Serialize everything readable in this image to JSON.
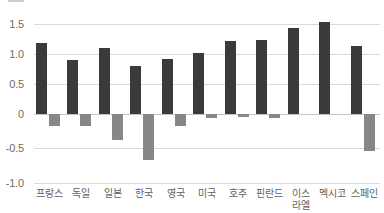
{
  "chart_data": {
    "type": "bar",
    "title": "",
    "subtitle": "",
    "xlabel": "",
    "ylabel": "",
    "ylim": [
      -1.0,
      1.5
    ],
    "yticks": [
      "1.5",
      "1.0",
      "0.5",
      "0",
      "-0.5",
      "-1.0"
    ],
    "ytick_values": [
      1.5,
      1.0,
      0.5,
      0,
      -0.5,
      -1.0
    ],
    "grid": true,
    "legend": "",
    "legend_position": "top-left",
    "categories": [
      "프랑스",
      "독일",
      "일본",
      "한국",
      "영국",
      "미국",
      "호주",
      "핀란드",
      "이스\n라엘",
      "멕시코",
      "스페인"
    ],
    "series": [
      {
        "name": "series-1",
        "color": "#3a3a3a",
        "values": [
          1.19,
          0.9,
          1.1,
          0.8,
          0.91,
          1.01,
          1.22,
          1.23,
          1.43,
          1.53,
          1.14
        ]
      },
      {
        "name": "series-2",
        "color": "#878787",
        "values": [
          -0.17,
          -0.17,
          -0.38,
          -0.66,
          -0.17,
          -0.06,
          -0.05,
          -0.06,
          0,
          0,
          -0.53
        ]
      }
    ]
  },
  "colors": {
    "primary_bar": "#3a3a3a",
    "secondary_bar": "#878787",
    "gridline": "#d9d9d9",
    "zero_line": "#c4c4c4",
    "tick_text": "#6e6e6e",
    "label_text": "#5f5f5f",
    "background": "#ffffff"
  }
}
